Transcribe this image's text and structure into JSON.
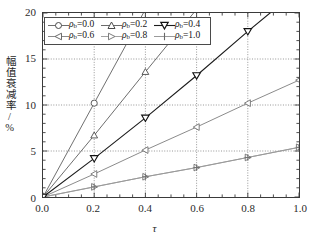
{
  "chart_data": {
    "type": "line",
    "title": "",
    "xlabel": "τ",
    "ylabel": "幅值衰减率/%",
    "xlim": [
      0.0,
      1.0
    ],
    "ylim": [
      0,
      20
    ],
    "xticks": [
      "0.0",
      "0.2",
      "0.4",
      "0.6",
      "0.8",
      "1.0"
    ],
    "xtick_values": [
      0.0,
      0.2,
      0.4,
      0.6,
      0.8,
      1.0
    ],
    "yticks": [
      "0",
      "5",
      "10",
      "15",
      "20"
    ],
    "ytick_values": [
      0,
      5,
      10,
      15,
      20
    ],
    "grid": true,
    "grid_style": "dotted-major",
    "minor_ticks": true,
    "legend_position": "upper-left-inside",
    "x": [
      0.0,
      0.2,
      0.4,
      0.6,
      0.8,
      1.0
    ],
    "series": [
      {
        "name": "ρb=0.0",
        "label_prefix": "ρ",
        "label_sub": "b",
        "label_value": "=0.0",
        "marker": "circle-open",
        "color": "#6e6e6e",
        "values": [
          0.0,
          10.2,
          20.4,
          30.6,
          40.8,
          51.0
        ],
        "visible_points": [
          0.0,
          10.2
        ]
      },
      {
        "name": "ρb=0.2",
        "label_prefix": "ρ",
        "label_sub": "b",
        "label_value": "=0.2",
        "marker": "triangle-up-open",
        "color": "#6b6b6b",
        "values": [
          0.0,
          6.7,
          13.6,
          20.4,
          27.2,
          34.0
        ],
        "visible_points": [
          0.0,
          6.7,
          13.6
        ]
      },
      {
        "name": "ρb=0.4",
        "label_prefix": "ρ",
        "label_sub": "b",
        "label_value": "=0.4",
        "marker": "triangle-down-open",
        "color": "#1c1c1c",
        "values": [
          0.0,
          4.2,
          8.6,
          13.2,
          18.0,
          22.6
        ],
        "visible_points": [
          0.0,
          4.2,
          8.6,
          13.2,
          18.0
        ]
      },
      {
        "name": "ρb=0.6",
        "label_prefix": "ρ",
        "label_sub": "b",
        "label_value": "=0.6",
        "marker": "triangle-left-open",
        "color": "#8a8a8a",
        "values": [
          0.0,
          2.5,
          5.1,
          7.6,
          10.2,
          12.7
        ],
        "visible_points": [
          0.0,
          2.5,
          5.1,
          7.6,
          10.2,
          12.7
        ]
      },
      {
        "name": "ρb=0.8",
        "label_prefix": "ρ",
        "label_sub": "b",
        "label_value": "=0.8",
        "marker": "triangle-right-open",
        "color": "#a2a2a2",
        "values": [
          0.0,
          1.1,
          2.2,
          3.2,
          4.3,
          5.4
        ],
        "visible_points": [
          0.0,
          1.1,
          2.2,
          3.2,
          4.3,
          5.4
        ]
      },
      {
        "name": "ρb=1.0",
        "label_prefix": "ρ",
        "label_sub": "b",
        "label_value": "=1.0",
        "marker": "plus",
        "color": "#9a9a9a",
        "values": [
          0.0,
          1.1,
          2.2,
          3.2,
          4.3,
          5.4
        ],
        "visible_points": [
          0.0,
          1.1,
          2.2,
          3.2,
          4.3,
          5.4
        ]
      }
    ]
  },
  "axis": {
    "y_title": "幅值衰减率/%",
    "x_title": "τ",
    "y_labels": [
      "20",
      "15",
      "10",
      "5",
      "0"
    ],
    "x_labels": [
      "0.0",
      "0.2",
      "0.4",
      "0.6",
      "0.8",
      "1.0"
    ]
  },
  "legend": {
    "rows": [
      [
        {
          "marker": "circle-open",
          "rho": "ρ",
          "sub": "b",
          "val": "=0.0"
        },
        {
          "marker": "triangle-up-open",
          "rho": "ρ",
          "sub": "b",
          "val": "=0.2"
        },
        {
          "marker": "triangle-down-open",
          "rho": "ρ",
          "sub": "b",
          "val": "=0.4"
        }
      ],
      [
        {
          "marker": "triangle-left-open",
          "rho": "ρ",
          "sub": "b",
          "val": "=0.6"
        },
        {
          "marker": "triangle-right-open",
          "rho": "ρ",
          "sub": "b",
          "val": "=0.8"
        },
        {
          "marker": "plus",
          "rho": "ρ",
          "sub": "b",
          "val": "=1.0"
        }
      ]
    ]
  },
  "colors": {
    "frame": "#3a3a3a",
    "grid": "#7a7a7a",
    "background": "#ffffff",
    "text": "#1f1f1f"
  }
}
